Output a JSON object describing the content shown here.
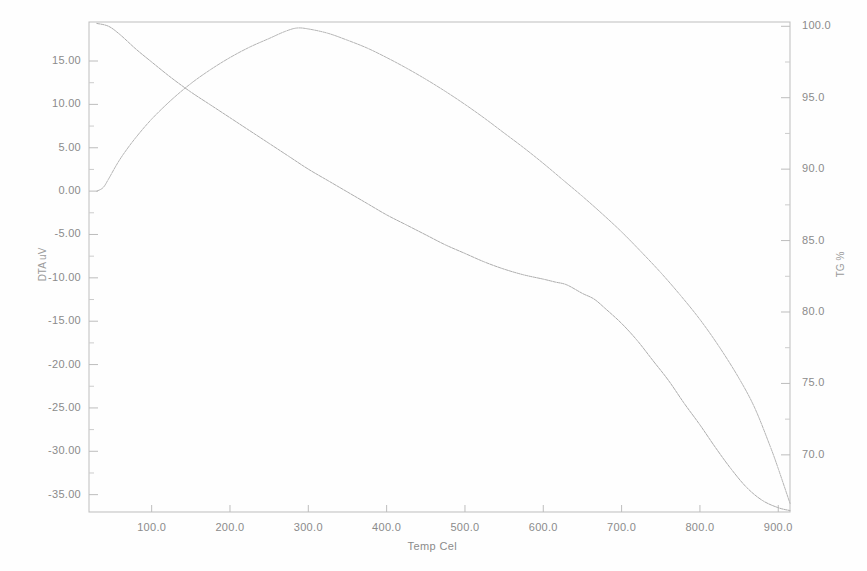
{
  "chart_data": {
    "type": "line",
    "title": "",
    "xlabel": "Temp Cel",
    "ylabel_left": "DTA uV",
    "ylabel_right": "TG %",
    "xlim": [
      20,
      915
    ],
    "ylim_left": [
      -37.0,
      19.5
    ],
    "ylim_right": [
      66.0,
      100.3
    ],
    "grid": false,
    "legend": "none",
    "xticks": [
      100.0,
      200.0,
      300.0,
      400.0,
      500.0,
      600.0,
      700.0,
      800.0,
      900.0
    ],
    "xtick_labels": [
      "100.0",
      "200.0",
      "300.0",
      "400.0",
      "500.0",
      "600.0",
      "700.0",
      "800.0",
      "900.0"
    ],
    "yticks_left": [
      15.0,
      10.0,
      5.0,
      0.0,
      -5.0,
      -10.0,
      -15.0,
      -20.0,
      -25.0,
      -30.0,
      -35.0
    ],
    "ytick_labels_left": [
      "15.00",
      "10.00",
      "5.00",
      "0.00",
      "-5.00",
      "-10.00",
      "-15.00",
      "-20.00",
      "-25.00",
      "-30.00",
      "-35.00"
    ],
    "yticks_right": [
      100.0,
      95.0,
      90.0,
      85.0,
      80.0,
      75.0,
      70.0
    ],
    "ytick_labels_right": [
      "100.0",
      "95.0",
      "90.0",
      "85.0",
      "80.0",
      "75.0",
      "70.0"
    ],
    "series": [
      {
        "name": "TG",
        "axis": "right",
        "unit": "%",
        "color": "#a9a9a9",
        "x": [
          30,
          45,
          60,
          80,
          100,
          125,
          150,
          175,
          200,
          225,
          250,
          275,
          300,
          325,
          350,
          375,
          400,
          425,
          450,
          475,
          500,
          525,
          550,
          575,
          600,
          615,
          630,
          650,
          665,
          680,
          700,
          720,
          740,
          760,
          780,
          800,
          820,
          840,
          860,
          880,
          900,
          915
        ],
        "values": [
          100.2,
          100.0,
          99.4,
          98.4,
          97.5,
          96.4,
          95.4,
          94.5,
          93.6,
          92.7,
          91.8,
          90.9,
          90.0,
          89.2,
          88.4,
          87.6,
          86.8,
          86.1,
          85.4,
          84.7,
          84.1,
          83.5,
          83.0,
          82.6,
          82.3,
          82.1,
          81.9,
          81.3,
          80.9,
          80.2,
          79.2,
          78.0,
          76.6,
          75.2,
          73.6,
          72.1,
          70.5,
          69.0,
          67.7,
          66.8,
          66.3,
          66.1
        ]
      },
      {
        "name": "DTA",
        "axis": "left",
        "unit": "uV",
        "color": "#b0b0b0",
        "x": [
          30,
          38,
          45,
          55,
          65,
          80,
          100,
          125,
          150,
          175,
          200,
          225,
          250,
          270,
          285,
          300,
          325,
          350,
          375,
          400,
          425,
          450,
          475,
          500,
          525,
          550,
          575,
          600,
          625,
          650,
          675,
          700,
          725,
          750,
          775,
          800,
          825,
          850,
          870,
          890,
          900,
          915
        ],
        "values": [
          0.0,
          0.4,
          1.4,
          3.0,
          4.4,
          6.2,
          8.3,
          10.5,
          12.4,
          14.0,
          15.4,
          16.6,
          17.6,
          18.4,
          18.8,
          18.7,
          18.2,
          17.4,
          16.5,
          15.4,
          14.2,
          12.9,
          11.5,
          10.0,
          8.4,
          6.7,
          5.0,
          3.2,
          1.3,
          -0.6,
          -2.6,
          -4.7,
          -7.0,
          -9.4,
          -12.0,
          -14.8,
          -18.0,
          -21.6,
          -25.0,
          -29.5,
          -32.0,
          -36.0
        ]
      }
    ],
    "annotations": []
  }
}
